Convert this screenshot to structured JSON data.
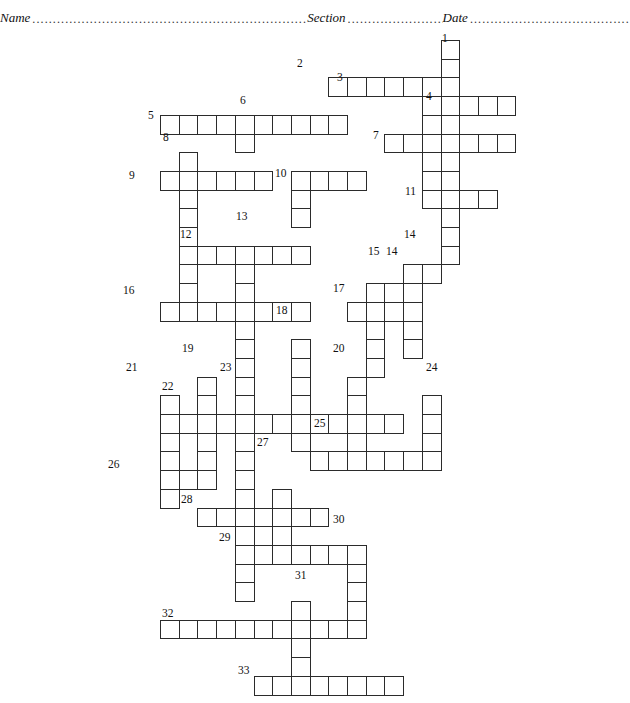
{
  "header": {
    "name_label": "Name",
    "section_label": "Section",
    "date_label": "Date",
    "dots": "................................................................................................................................"
  },
  "puzzle": {
    "title": "crossword-puzzle-grid",
    "cell_size": 18.7,
    "origin_x": 160,
    "origin_y": 14,
    "grid_line_color": "#2b2b2b",
    "cell_fill": "#ffffff",
    "numbers": [
      {
        "n": "1",
        "x": 442,
        "y": 33
      },
      {
        "n": "2",
        "x": 297,
        "y": 58
      },
      {
        "n": "3",
        "x": 337,
        "y": 72
      },
      {
        "n": "4",
        "x": 426,
        "y": 91
      },
      {
        "n": "5",
        "x": 148,
        "y": 110
      },
      {
        "n": "6",
        "x": 240,
        "y": 95
      },
      {
        "n": "7",
        "x": 373,
        "y": 130
      },
      {
        "n": "8",
        "x": 163,
        "y": 132
      },
      {
        "n": "9",
        "x": 129,
        "y": 170
      },
      {
        "n": "10",
        "x": 275,
        "y": 168
      },
      {
        "n": "11",
        "x": 405,
        "y": 186
      },
      {
        "n": "12",
        "x": 180,
        "y": 229
      },
      {
        "n": "13",
        "x": 236,
        "y": 211
      },
      {
        "n": "14",
        "x": 404,
        "y": 229
      },
      {
        "n": "14",
        "x": 386,
        "y": 246
      },
      {
        "n": "15",
        "x": 368,
        "y": 246
      },
      {
        "n": "16",
        "x": 123,
        "y": 285
      },
      {
        "n": "17",
        "x": 333,
        "y": 283
      },
      {
        "n": "18",
        "x": 276,
        "y": 305
      },
      {
        "n": "19",
        "x": 182,
        "y": 343
      },
      {
        "n": "20",
        "x": 333,
        "y": 343
      },
      {
        "n": "21",
        "x": 126,
        "y": 362
      },
      {
        "n": "22",
        "x": 162,
        "y": 381
      },
      {
        "n": "23",
        "x": 220,
        "y": 362
      },
      {
        "n": "24",
        "x": 426,
        "y": 362
      },
      {
        "n": "25",
        "x": 314,
        "y": 418
      },
      {
        "n": "26",
        "x": 108,
        "y": 459
      },
      {
        "n": "27",
        "x": 257,
        "y": 437
      },
      {
        "n": "28",
        "x": 181,
        "y": 494
      },
      {
        "n": "29",
        "x": 219,
        "y": 532
      },
      {
        "n": "30",
        "x": 333,
        "y": 514
      },
      {
        "n": "31",
        "x": 295,
        "y": 570
      },
      {
        "n": "32",
        "x": 162,
        "y": 608
      },
      {
        "n": "33",
        "x": 238,
        "y": 665
      }
    ],
    "cells": [
      {
        "r": 0,
        "c": 15
      },
      {
        "r": 1,
        "c": 15
      },
      {
        "r": 2,
        "c": 9
      },
      {
        "r": 2,
        "c": 10
      },
      {
        "r": 2,
        "c": 11
      },
      {
        "r": 2,
        "c": 12
      },
      {
        "r": 2,
        "c": 13
      },
      {
        "r": 2,
        "c": 14
      },
      {
        "r": 2,
        "c": 15
      },
      {
        "r": 3,
        "c": 14
      },
      {
        "r": 3,
        "c": 15
      },
      {
        "r": 3,
        "c": 16
      },
      {
        "r": 3,
        "c": 17
      },
      {
        "r": 3,
        "c": 18
      },
      {
        "r": 4,
        "c": 0
      },
      {
        "r": 4,
        "c": 1
      },
      {
        "r": 4,
        "c": 2
      },
      {
        "r": 4,
        "c": 3
      },
      {
        "r": 4,
        "c": 4
      },
      {
        "r": 4,
        "c": 5
      },
      {
        "r": 4,
        "c": 6
      },
      {
        "r": 4,
        "c": 7
      },
      {
        "r": 4,
        "c": 8
      },
      {
        "r": 4,
        "c": 9
      },
      {
        "r": 4,
        "c": 14
      },
      {
        "r": 4,
        "c": 15
      },
      {
        "r": 5,
        "c": 4
      },
      {
        "r": 5,
        "c": 14
      },
      {
        "r": 5,
        "c": 15
      },
      {
        "r": 5,
        "c": 12
      },
      {
        "r": 5,
        "c": 13
      },
      {
        "r": 5,
        "c": 16
      },
      {
        "r": 5,
        "c": 17
      },
      {
        "r": 5,
        "c": 18
      },
      {
        "r": 6,
        "c": 1
      },
      {
        "r": 6,
        "c": 14
      },
      {
        "r": 6,
        "c": 15
      },
      {
        "r": 7,
        "c": 0
      },
      {
        "r": 7,
        "c": 1
      },
      {
        "r": 7,
        "c": 2
      },
      {
        "r": 7,
        "c": 3
      },
      {
        "r": 7,
        "c": 4
      },
      {
        "r": 7,
        "c": 5
      },
      {
        "r": 7,
        "c": 7
      },
      {
        "r": 7,
        "c": 8
      },
      {
        "r": 7,
        "c": 9
      },
      {
        "r": 7,
        "c": 10
      },
      {
        "r": 7,
        "c": 14
      },
      {
        "r": 7,
        "c": 15
      },
      {
        "r": 8,
        "c": 1
      },
      {
        "r": 8,
        "c": 7
      },
      {
        "r": 8,
        "c": 14
      },
      {
        "r": 8,
        "c": 15
      },
      {
        "r": 8,
        "c": 16
      },
      {
        "r": 8,
        "c": 17
      },
      {
        "r": 9,
        "c": 1
      },
      {
        "r": 9,
        "c": 7
      },
      {
        "r": 9,
        "c": 15
      },
      {
        "r": 10,
        "c": 1
      },
      {
        "r": 10,
        "c": 15
      },
      {
        "r": 11,
        "c": 1
      },
      {
        "r": 11,
        "c": 4
      },
      {
        "r": 11,
        "c": 2
      },
      {
        "r": 11,
        "c": 3
      },
      {
        "r": 11,
        "c": 5
      },
      {
        "r": 11,
        "c": 6
      },
      {
        "r": 11,
        "c": 7
      },
      {
        "r": 11,
        "c": 15
      },
      {
        "r": 12,
        "c": 1
      },
      {
        "r": 12,
        "c": 4
      },
      {
        "r": 12,
        "c": 13
      },
      {
        "r": 12,
        "c": 14
      },
      {
        "r": 13,
        "c": 1
      },
      {
        "r": 13,
        "c": 4
      },
      {
        "r": 13,
        "c": 11
      },
      {
        "r": 13,
        "c": 12
      },
      {
        "r": 13,
        "c": 13
      },
      {
        "r": 14,
        "c": 0
      },
      {
        "r": 14,
        "c": 1
      },
      {
        "r": 14,
        "c": 2
      },
      {
        "r": 14,
        "c": 3
      },
      {
        "r": 14,
        "c": 4
      },
      {
        "r": 14,
        "c": 5
      },
      {
        "r": 14,
        "c": 6
      },
      {
        "r": 14,
        "c": 7
      },
      {
        "r": 14,
        "c": 10
      },
      {
        "r": 14,
        "c": 11
      },
      {
        "r": 14,
        "c": 12
      },
      {
        "r": 14,
        "c": 13
      },
      {
        "r": 15,
        "c": 4
      },
      {
        "r": 15,
        "c": 11
      },
      {
        "r": 15,
        "c": 13
      },
      {
        "r": 16,
        "c": 4
      },
      {
        "r": 16,
        "c": 7
      },
      {
        "r": 16,
        "c": 11
      },
      {
        "r": 16,
        "c": 13
      },
      {
        "r": 17,
        "c": 4
      },
      {
        "r": 17,
        "c": 7
      },
      {
        "r": 17,
        "c": 11
      },
      {
        "r": 18,
        "c": 2
      },
      {
        "r": 18,
        "c": 4
      },
      {
        "r": 18,
        "c": 7
      },
      {
        "r": 18,
        "c": 10
      },
      {
        "r": 19,
        "c": 0
      },
      {
        "r": 19,
        "c": 2
      },
      {
        "r": 19,
        "c": 4
      },
      {
        "r": 19,
        "c": 7
      },
      {
        "r": 19,
        "c": 10
      },
      {
        "r": 19,
        "c": 14
      },
      {
        "r": 20,
        "c": 0
      },
      {
        "r": 20,
        "c": 1
      },
      {
        "r": 20,
        "c": 2
      },
      {
        "r": 20,
        "c": 3
      },
      {
        "r": 20,
        "c": 4
      },
      {
        "r": 20,
        "c": 5
      },
      {
        "r": 20,
        "c": 6
      },
      {
        "r": 20,
        "c": 7
      },
      {
        "r": 20,
        "c": 8
      },
      {
        "r": 20,
        "c": 9
      },
      {
        "r": 20,
        "c": 10
      },
      {
        "r": 20,
        "c": 11
      },
      {
        "r": 20,
        "c": 12
      },
      {
        "r": 20,
        "c": 14
      },
      {
        "r": 21,
        "c": 0
      },
      {
        "r": 21,
        "c": 2
      },
      {
        "r": 21,
        "c": 4
      },
      {
        "r": 21,
        "c": 7
      },
      {
        "r": 21,
        "c": 10
      },
      {
        "r": 21,
        "c": 14
      },
      {
        "r": 22,
        "c": 0
      },
      {
        "r": 22,
        "c": 2
      },
      {
        "r": 22,
        "c": 4
      },
      {
        "r": 22,
        "c": 10
      },
      {
        "r": 22,
        "c": 14
      },
      {
        "r": 22,
        "c": 8
      },
      {
        "r": 22,
        "c": 9
      },
      {
        "r": 22,
        "c": 11
      },
      {
        "r": 22,
        "c": 12
      },
      {
        "r": 22,
        "c": 13
      },
      {
        "r": 23,
        "c": 0
      },
      {
        "r": 23,
        "c": 1
      },
      {
        "r": 23,
        "c": 2
      },
      {
        "r": 23,
        "c": 4
      },
      {
        "r": 24,
        "c": 0
      },
      {
        "r": 24,
        "c": 4
      },
      {
        "r": 24,
        "c": 6
      },
      {
        "r": 25,
        "c": 2
      },
      {
        "r": 25,
        "c": 3
      },
      {
        "r": 25,
        "c": 4
      },
      {
        "r": 25,
        "c": 5
      },
      {
        "r": 25,
        "c": 6
      },
      {
        "r": 25,
        "c": 7
      },
      {
        "r": 25,
        "c": 8
      },
      {
        "r": 26,
        "c": 4
      },
      {
        "r": 26,
        "c": 6
      },
      {
        "r": 27,
        "c": 4
      },
      {
        "r": 27,
        "c": 5
      },
      {
        "r": 27,
        "c": 6
      },
      {
        "r": 27,
        "c": 7
      },
      {
        "r": 27,
        "c": 8
      },
      {
        "r": 27,
        "c": 9
      },
      {
        "r": 27,
        "c": 10
      },
      {
        "r": 28,
        "c": 4
      },
      {
        "r": 28,
        "c": 10
      },
      {
        "r": 29,
        "c": 4
      },
      {
        "r": 29,
        "c": 10
      },
      {
        "r": 30,
        "c": 7
      },
      {
        "r": 30,
        "c": 10
      },
      {
        "r": 31,
        "c": 0
      },
      {
        "r": 31,
        "c": 1
      },
      {
        "r": 31,
        "c": 2
      },
      {
        "r": 31,
        "c": 3
      },
      {
        "r": 31,
        "c": 4
      },
      {
        "r": 31,
        "c": 5
      },
      {
        "r": 31,
        "c": 6
      },
      {
        "r": 31,
        "c": 7
      },
      {
        "r": 31,
        "c": 8
      },
      {
        "r": 31,
        "c": 9
      },
      {
        "r": 31,
        "c": 10
      },
      {
        "r": 32,
        "c": 7
      },
      {
        "r": 33,
        "c": 7
      },
      {
        "r": 34,
        "c": 5
      },
      {
        "r": 34,
        "c": 6
      },
      {
        "r": 34,
        "c": 7
      },
      {
        "r": 34,
        "c": 8
      },
      {
        "r": 34,
        "c": 9
      },
      {
        "r": 34,
        "c": 10
      },
      {
        "r": 34,
        "c": 11
      },
      {
        "r": 34,
        "c": 12
      }
    ]
  }
}
